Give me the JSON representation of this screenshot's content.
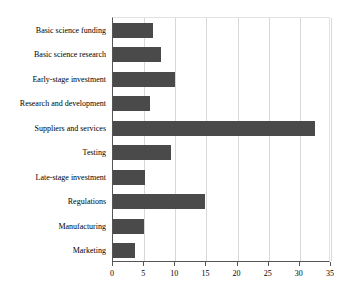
{
  "chart_data": {
    "type": "bar",
    "orientation": "horizontal",
    "title": "",
    "xlabel": "",
    "ylabel": "",
    "xlim": [
      0,
      35
    ],
    "xticks": [
      0,
      5,
      10,
      15,
      20,
      25,
      30,
      35
    ],
    "grid": true,
    "legend": false,
    "bar_color": "#4a4a4a",
    "background_color": "#ffffff",
    "gridline_color": "#d8d8d8",
    "axis_color": "#555555",
    "categories": [
      "Basic science funding",
      "Basic science research",
      "Early-stage investment",
      "Research and development",
      "Suppliers and services",
      "Testing",
      "Late-stage investment",
      "Regulations",
      "Manufacturing",
      "Marketing"
    ],
    "values": [
      6.5,
      7.7,
      9.9,
      6.0,
      32.5,
      9.3,
      5.2,
      14.7,
      5.0,
      3.5
    ]
  }
}
